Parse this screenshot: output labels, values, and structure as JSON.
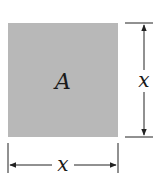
{
  "diagram": {
    "square": {
      "label": "A",
      "fill": "#b8b8b8"
    },
    "height_dimension": {
      "label": "x"
    },
    "width_dimension": {
      "label": "x"
    },
    "line_color": "#222222"
  }
}
